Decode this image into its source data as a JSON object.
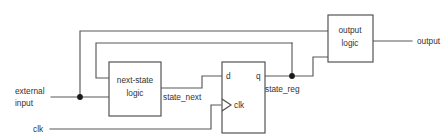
{
  "diagram": {
    "colors": {
      "wire": "#595959",
      "box_stroke": "#4d4d4d",
      "text": "#333333",
      "background": "#ffffff",
      "junction": "#1a1a1a"
    },
    "blocks": [
      {
        "id": "next-state-logic",
        "line1": "next-state",
        "line2": "logic"
      },
      {
        "id": "state-register",
        "line1": "",
        "line2": ""
      },
      {
        "id": "output-logic",
        "line1": "output",
        "line2": "logic"
      }
    ],
    "pins": {
      "d": "d",
      "q": "q",
      "clk_pin": "clk"
    },
    "signals": {
      "external_input_line1": "external",
      "external_input_line2": "input",
      "clk": "clk",
      "state_next": "state_next",
      "state_reg": "state_reg",
      "output": "output"
    }
  }
}
